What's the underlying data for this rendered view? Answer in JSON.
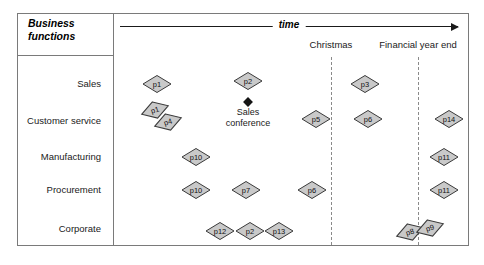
{
  "diagram": {
    "title": "Business functions",
    "time_axis_label": "time",
    "rows": [
      {
        "label": "Sales",
        "y": 84
      },
      {
        "label": "Customer service",
        "y": 121
      },
      {
        "label": "Manufacturing",
        "y": 157
      },
      {
        "label": "Procurement",
        "y": 190
      },
      {
        "label": "Corporate",
        "y": 229
      }
    ],
    "events": [
      {
        "label": "Christmas",
        "x": 331
      },
      {
        "label": "Financial year end",
        "x": 418
      }
    ],
    "annotation": {
      "label_line1": "Sales",
      "label_line2": "conference",
      "marker_x": 248,
      "marker_y": 102,
      "text_x": 248,
      "text_y": 107
    },
    "nodes": [
      {
        "id": "p1",
        "label": "p1",
        "x": 157,
        "y": 84,
        "tilt": false
      },
      {
        "id": "p2a",
        "label": "p2",
        "x": 248,
        "y": 81,
        "tilt": false
      },
      {
        "id": "p3",
        "label": "p3",
        "x": 365,
        "y": 84,
        "tilt": false
      },
      {
        "id": "p1b",
        "label": "p1",
        "x": 155,
        "y": 110,
        "tilt": true
      },
      {
        "id": "p4",
        "label": "p4",
        "x": 168,
        "y": 122,
        "tilt": true
      },
      {
        "id": "p5",
        "label": "p5",
        "x": 316,
        "y": 119,
        "tilt": false
      },
      {
        "id": "p6a",
        "label": "p6",
        "x": 368,
        "y": 119,
        "tilt": false
      },
      {
        "id": "p14",
        "label": "p14",
        "x": 449,
        "y": 119,
        "tilt": false
      },
      {
        "id": "p10a",
        "label": "p10",
        "x": 196,
        "y": 157,
        "tilt": false
      },
      {
        "id": "p11a",
        "label": "p11",
        "x": 444,
        "y": 157,
        "tilt": false
      },
      {
        "id": "p10b",
        "label": "p10",
        "x": 196,
        "y": 190,
        "tilt": false
      },
      {
        "id": "p7",
        "label": "p7",
        "x": 246,
        "y": 190,
        "tilt": false
      },
      {
        "id": "p6b",
        "label": "p6",
        "x": 312,
        "y": 190,
        "tilt": false
      },
      {
        "id": "p11b",
        "label": "p11",
        "x": 444,
        "y": 190,
        "tilt": false
      },
      {
        "id": "p12",
        "label": "p12",
        "x": 220,
        "y": 231,
        "tilt": false
      },
      {
        "id": "p2b",
        "label": "p2",
        "x": 250,
        "y": 231,
        "tilt": false
      },
      {
        "id": "p13",
        "label": "p13",
        "x": 279,
        "y": 231,
        "tilt": false
      },
      {
        "id": "p8",
        "label": "p8",
        "x": 410,
        "y": 232,
        "tilt": true
      },
      {
        "id": "p9",
        "label": "p9",
        "x": 430,
        "y": 228,
        "tilt": true
      }
    ],
    "colors": {
      "node_fill": "#c9c9c9",
      "node_stroke": "#3a3a3a",
      "frame_stroke": "#7a7a7a",
      "event_line": "#8a8a8a",
      "axis": "#1a1a1a"
    }
  }
}
